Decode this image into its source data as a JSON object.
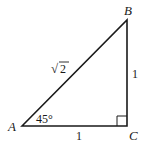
{
  "diagram": {
    "vertices": {
      "A": {
        "label": "A",
        "x": 22,
        "y": 126
      },
      "B": {
        "label": "B",
        "x": 127,
        "y": 20
      },
      "C": {
        "label": "C",
        "x": 127,
        "y": 126
      }
    },
    "sides": {
      "hypotenuse": {
        "label": "√2",
        "radical": "√",
        "radicand": "2"
      },
      "vertical": {
        "label": "1"
      },
      "horizontal": {
        "label": "1"
      }
    },
    "angle_A": {
      "label": "45°"
    },
    "right_angle_at": "C",
    "colors": {
      "stroke": "#1a1a1a",
      "background": "#ffffff"
    }
  }
}
